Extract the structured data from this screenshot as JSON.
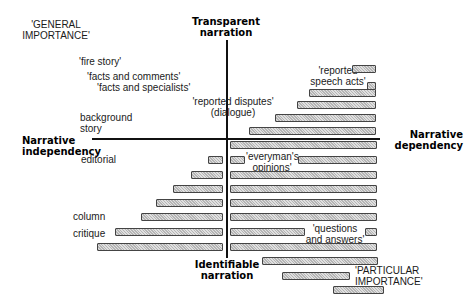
{
  "axes": {
    "top": "Transparent narration",
    "top_lines": [
      "Transparent",
      "narration"
    ],
    "bottom_lines": [
      "Identifiable",
      "narration"
    ],
    "left_lines": [
      "Narrative",
      "independency"
    ],
    "right_lines": [
      "Narrative",
      "dependency"
    ]
  },
  "labels": {
    "general_importance": [
      "'GENERAL",
      "IMPORTANCE'"
    ],
    "fire_story": "'fire story'",
    "facts_and_comments": "'facts and comments'",
    "facts_and_specialists": "'facts and specialists'",
    "reported_disputes": "'reported disputes'",
    "dialogue": "(dialogue)",
    "background_story": [
      "background",
      "story"
    ],
    "editorial": "editorial",
    "column": "column",
    "critique": "critique",
    "reported_speech_acts": [
      "'reported",
      "speech acts'"
    ],
    "everymans_opinions": [
      "'everyman's",
      "opinions'"
    ],
    "questions_and_answers": [
      "'questions",
      "and answers'"
    ],
    "particular_importance": [
      "'PARTICULAR",
      "IMPORTANCE'"
    ]
  },
  "bars": [
    {
      "x": 352,
      "y": 65,
      "w": 24
    },
    {
      "x": 367,
      "y": 82,
      "w": 9
    },
    {
      "x": 309,
      "y": 89,
      "w": 67
    },
    {
      "x": 297,
      "y": 101,
      "w": 79
    },
    {
      "x": 275,
      "y": 114,
      "w": 101
    },
    {
      "x": 249,
      "y": 127,
      "w": 127
    },
    {
      "x": 230,
      "y": 141,
      "w": 147
    },
    {
      "x": 208,
      "y": 156,
      "w": 15
    },
    {
      "x": 230,
      "y": 156,
      "w": 15
    },
    {
      "x": 298,
      "y": 156,
      "w": 79
    },
    {
      "x": 191,
      "y": 171,
      "w": 32
    },
    {
      "x": 230,
      "y": 171,
      "w": 147
    },
    {
      "x": 173,
      "y": 185,
      "w": 50
    },
    {
      "x": 230,
      "y": 185,
      "w": 147
    },
    {
      "x": 156,
      "y": 199,
      "w": 67
    },
    {
      "x": 230,
      "y": 199,
      "w": 147
    },
    {
      "x": 141,
      "y": 213,
      "w": 82
    },
    {
      "x": 230,
      "y": 213,
      "w": 147
    },
    {
      "x": 115,
      "y": 228,
      "w": 108
    },
    {
      "x": 230,
      "y": 228,
      "w": 75
    },
    {
      "x": 365,
      "y": 228,
      "w": 12
    },
    {
      "x": 97,
      "y": 243,
      "w": 126
    },
    {
      "x": 230,
      "y": 243,
      "w": 147
    },
    {
      "x": 262,
      "y": 257,
      "w": 116
    },
    {
      "x": 282,
      "y": 272,
      "w": 68
    },
    {
      "x": 333,
      "y": 286,
      "w": 51
    }
  ]
}
